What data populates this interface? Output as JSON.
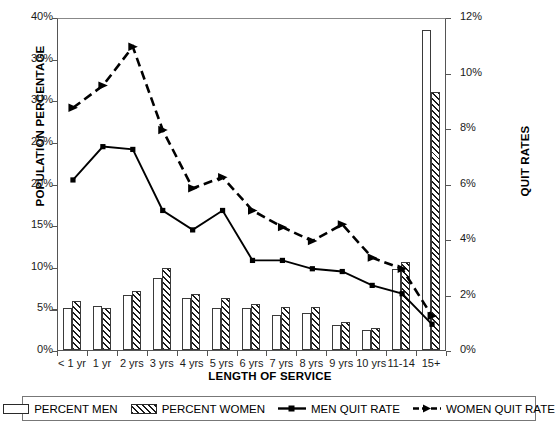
{
  "chart_data": {
    "type": "bar",
    "title": "",
    "xlabel": "LENGTH OF SERVICE",
    "ylabel": "POPULATION PERCENTAGE",
    "ylabel_right": "QUIT RATES",
    "grid": false,
    "legend_position": "bottom",
    "categories": [
      "< 1 yr",
      "1 yr",
      "2 yrs",
      "3 yrs",
      "4 yrs",
      "5 yrs",
      "6 yrs",
      "7 yrs",
      "8 yrs",
      "9 yrs",
      "10 yrs",
      "11-14",
      "15+"
    ],
    "ylim": [
      0,
      40
    ],
    "yticks": [
      0,
      5,
      10,
      15,
      20,
      25,
      30,
      35,
      40
    ],
    "ytick_labels": [
      "0%",
      "5%",
      "10%",
      "15%",
      "20%",
      "25%",
      "30%",
      "35%",
      "40%"
    ],
    "ylim_right": [
      0,
      12
    ],
    "yticks_right": [
      0,
      2,
      4,
      6,
      8,
      10,
      12
    ],
    "ytick_labels_right": [
      "0%",
      "2%",
      "4%",
      "6%",
      "8%",
      "10%",
      "12%"
    ],
    "series": [
      {
        "name": "PERCENT MEN",
        "type": "bar",
        "axis": "left",
        "values": [
          5.1,
          5.3,
          6.6,
          8.6,
          6.2,
          5.0,
          5.1,
          4.2,
          4.4,
          3.0,
          2.4,
          9.7,
          38.5
        ]
      },
      {
        "name": "PERCENT WOMEN",
        "type": "bar",
        "axis": "left",
        "values": [
          5.9,
          5.0,
          7.1,
          9.8,
          6.7,
          6.2,
          5.5,
          5.2,
          5.2,
          3.4,
          2.6,
          10.6,
          31.0
        ]
      },
      {
        "name": "MEN QUIT RATE",
        "type": "line",
        "axis": "right",
        "values": [
          6.2,
          7.4,
          7.3,
          5.1,
          4.4,
          5.1,
          3.3,
          3.3,
          3.0,
          2.9,
          2.4,
          2.1,
          1.0
        ]
      },
      {
        "name": "WOMEN QUIT RATE",
        "type": "line",
        "axis": "right",
        "values": [
          8.8,
          9.6,
          11.0,
          8.0,
          5.9,
          6.3,
          5.1,
          4.5,
          4.0,
          4.6,
          3.4,
          3.0,
          1.3
        ]
      }
    ]
  },
  "axes": {
    "y_left_title": "POPULATION PERCENTAGE",
    "y_right_title": "QUIT RATES",
    "x_title": "LENGTH OF SERVICE"
  },
  "legend": {
    "items": [
      {
        "label": "PERCENT MEN",
        "marker": "bar-open-swatch"
      },
      {
        "label": "PERCENT WOMEN",
        "marker": "bar-hatched-swatch"
      },
      {
        "label": "MEN QUIT RATE",
        "marker": "solid-line-square-marker"
      },
      {
        "label": "WOMEN QUIT RATE",
        "marker": "dashed-line-triangle-marker"
      }
    ]
  }
}
